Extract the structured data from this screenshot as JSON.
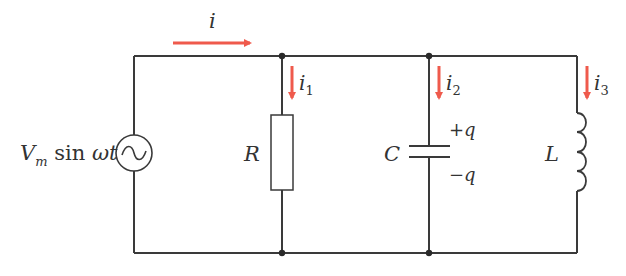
{
  "diagram": {
    "type": "circuit",
    "colors": {
      "wire": "#3a3a3a",
      "current_arrow": "#ef5a4c",
      "label": "#333333"
    },
    "source": {
      "label_main": "V",
      "label_sub": "m",
      "label_rest": " sin ",
      "label_omega": "ωt"
    },
    "main_current": {
      "label": "i"
    },
    "branches": [
      {
        "component": "resistor",
        "label": "R",
        "current": "i",
        "current_sub": "1"
      },
      {
        "component": "capacitor",
        "label": "C",
        "current": "i",
        "current_sub": "2",
        "plus_charge": "+q",
        "minus_charge": "−q"
      },
      {
        "component": "inductor",
        "label": "L",
        "current": "i",
        "current_sub": "3"
      }
    ]
  }
}
